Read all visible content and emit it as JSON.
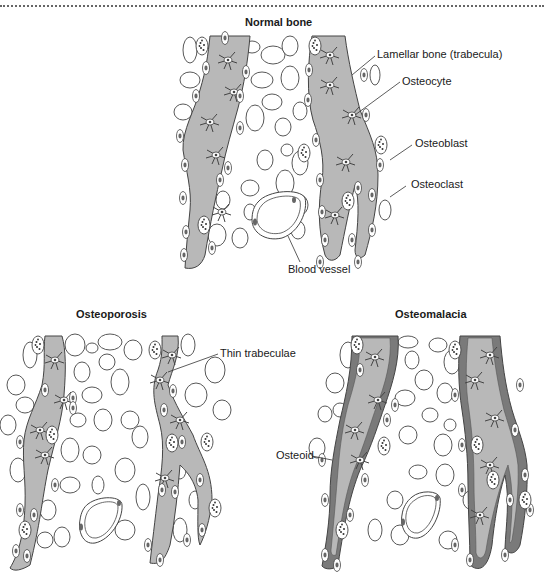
{
  "panels": {
    "normal": {
      "title": "Normal bone",
      "labels": {
        "lamellar": "Lamellar bone (trabecula)",
        "osteocyte": "Osteocyte",
        "osteoblast": "Osteoblast",
        "osteoclast": "Osteoclast",
        "blood_vessel": "Blood vessel"
      }
    },
    "osteoporosis": {
      "title": "Osteoporosis",
      "labels": {
        "thin_trabeculae": "Thin trabeculae"
      }
    },
    "osteomalacia": {
      "title": "Osteomalacia",
      "labels": {
        "osteoid": "Osteoid"
      }
    }
  },
  "colors": {
    "bone": "#b8b8b8",
    "osteoid": "#7a7a7a",
    "outline": "#333333",
    "background": "#ffffff"
  }
}
